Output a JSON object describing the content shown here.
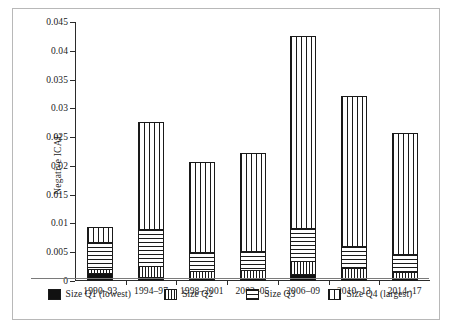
{
  "chart_data": {
    "type": "bar",
    "stacked": true,
    "title": "",
    "xlabel": "",
    "ylabel": "Negative ICAE",
    "ylim": [
      0,
      0.045
    ],
    "ytick_labels": [
      "0",
      "0.005",
      "0.01",
      "0.015",
      "0.02",
      "0.025",
      "0.03",
      "0.035",
      "0.04",
      "0.045"
    ],
    "ytick_values": [
      0,
      0.005,
      0.01,
      0.015,
      0.02,
      0.025,
      0.03,
      0.035,
      0.04,
      0.045
    ],
    "grid": false,
    "legend_position": "bottom",
    "categories": [
      "1990–93",
      "1994–97",
      "1998–2001",
      "2002–05",
      "2006–09",
      "2010–13",
      "2014–17"
    ],
    "series": [
      {
        "name": "Size Q1 (lowest)",
        "pattern": "solid-black",
        "values": [
          0.001,
          0.0004,
          0.0002,
          0.0002,
          0.0009,
          0.0002,
          0.0002
        ]
      },
      {
        "name": "Size Q2",
        "pattern": "dense-vertical-lines",
        "values": [
          0.0008,
          0.0019,
          0.0012,
          0.0014,
          0.0022,
          0.0018,
          0.001
        ]
      },
      {
        "name": "Size Q3",
        "pattern": "horizontal-lines",
        "values": [
          0.0049,
          0.0065,
          0.0033,
          0.0034,
          0.0059,
          0.0038,
          0.0032
        ]
      },
      {
        "name": "Size Q4 (largest)",
        "pattern": "wide-vertical-lines",
        "values": [
          0.0026,
          0.0189,
          0.0159,
          0.0173,
          0.0335,
          0.0264,
          0.0214
        ]
      }
    ],
    "totals": [
      0.0093,
      0.0277,
      0.0206,
      0.0223,
      0.0425,
      0.0322,
      0.0258
    ]
  },
  "legend": {
    "items": [
      {
        "label": "Size Q1 (lowest)",
        "pattern": "pat-q1"
      },
      {
        "label": "Size Q2",
        "pattern": "pat-q2"
      },
      {
        "label": "Size Q3",
        "pattern": "pat-q3"
      },
      {
        "label": "Size Q4 (largest)",
        "pattern": "pat-q4"
      }
    ]
  },
  "colors": {
    "axis": "#2b2b2b",
    "ink": "#1a1a1a",
    "background": "#ffffff",
    "frame": "#b8b8b8"
  }
}
